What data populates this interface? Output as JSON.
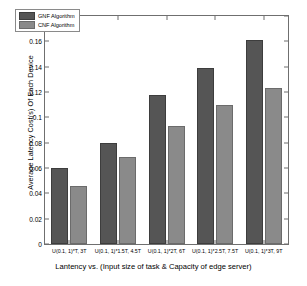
{
  "chart_data": {
    "type": "bar",
    "title": "",
    "xlabel": "Lantency vs. (Input size of task & Capacity of edge server)",
    "ylabel": "Average Latency Cost(s) Of Each Device",
    "categories": [
      "U(0.1, 1)*T, 3T",
      "U(0.1, 1)*1.5T, 4.5T",
      "U(0.1, 1)*2T, 6T",
      "U(0.1, 1)*2.5T, 7.5T",
      "U(0.1, 1)*3T, 9T"
    ],
    "series": [
      {
        "name": "GNF Algorithm",
        "color": "#555555",
        "values": [
          0.06,
          0.08,
          0.118,
          0.139,
          0.161
        ]
      },
      {
        "name": "CNF Algorithm",
        "color": "#8a8a8a",
        "values": [
          0.046,
          0.069,
          0.093,
          0.11,
          0.123
        ]
      }
    ],
    "ylim": [
      0,
      0.18
    ],
    "ytick_labels": [
      "0",
      "0.02",
      "0.04",
      "0.06",
      "0.08",
      "0.1",
      "0.12",
      "0.14",
      "0.16",
      "0.18"
    ],
    "ytick_values": [
      0,
      0.02,
      0.04,
      0.06,
      0.08,
      0.1,
      0.12,
      0.14,
      0.16,
      0.18
    ],
    "grid": false,
    "legend_position": "upper left"
  }
}
